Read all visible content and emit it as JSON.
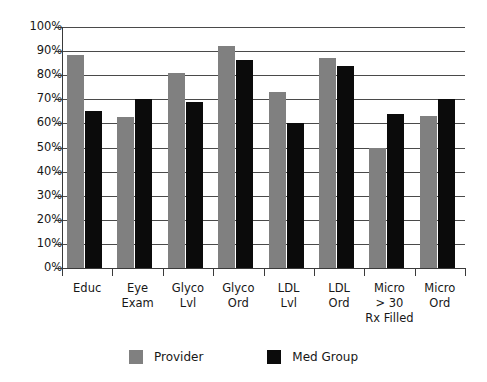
{
  "chart_data": {
    "type": "bar",
    "title": "",
    "subtitle": "",
    "xlabel": "",
    "ylabel": "",
    "ylim": [
      0,
      100
    ],
    "ytick_labels": [
      "100%",
      "90%",
      "80%",
      "70%",
      "60%",
      "50%",
      "40%",
      "30%",
      "20%",
      "10%",
      "0%"
    ],
    "ytick_values": [
      100,
      90,
      80,
      70,
      60,
      50,
      40,
      30,
      20,
      10,
      0
    ],
    "grid": true,
    "legend_position": "bottom",
    "categories": [
      "Educ",
      "Eye\nExam",
      "Glyco\nLvl",
      "Glyco\nOrd",
      "LDL\nLvl",
      "LDL\nOrd",
      "Micro\n> 30\nRx Filled",
      "Micro\nOrd"
    ],
    "series": [
      {
        "name": "Provider",
        "color": "#808080",
        "values": [
          88.5,
          62.5,
          81,
          92,
          73,
          87,
          50,
          63
        ]
      },
      {
        "name": "Med Group",
        "color": "#0b0b0b",
        "values": [
          65,
          70,
          69,
          86.5,
          60,
          84,
          64,
          70
        ]
      }
    ]
  },
  "legend": {
    "items": [
      {
        "label": "Provider",
        "color": "#808080",
        "swatch": "legend-swatch-provider"
      },
      {
        "label": "Med Group",
        "color": "#0b0b0b",
        "swatch": "legend-swatch-med-group"
      }
    ]
  }
}
